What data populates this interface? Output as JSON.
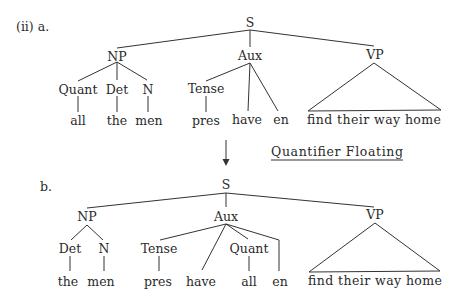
{
  "example_label": "(ii) a.",
  "tree_a": {
    "label": "a.",
    "nodes": {
      "S": "S",
      "NP": "NP",
      "Aux": "Aux",
      "VP": "VP",
      "Quant": "Quant",
      "Det": "Det",
      "N": "N",
      "Tense": "Tense"
    },
    "leaves": {
      "all": "all",
      "the": "the",
      "men": "men",
      "pres": "pres",
      "have": "have",
      "en": "en",
      "vp_phrase": "find their way home"
    }
  },
  "transformation": {
    "name": "Quantifier Floating",
    "arrow": "down-arrow-icon"
  },
  "tree_b": {
    "label": "b.",
    "nodes": {
      "S": "S",
      "NP": "NP",
      "Aux": "Aux",
      "VP": "VP",
      "Det": "Det",
      "N": "N",
      "Tense": "Tense",
      "Quant": "Quant"
    },
    "leaves": {
      "the": "the",
      "men": "men",
      "pres": "pres",
      "have": "have",
      "all": "all",
      "en": "en",
      "vp_phrase": "find their way home"
    }
  }
}
